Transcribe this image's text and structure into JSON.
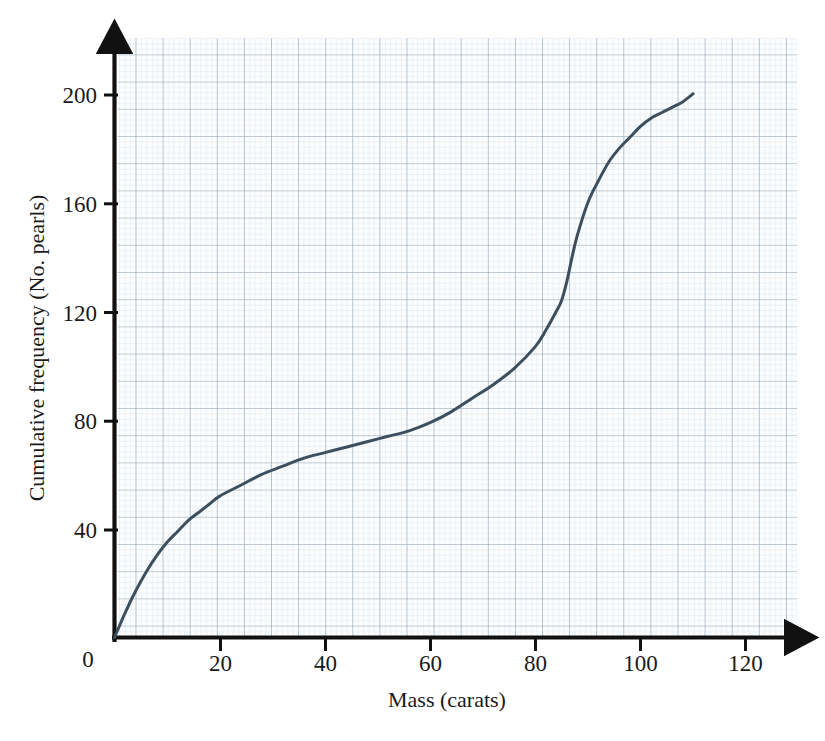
{
  "chart_data": {
    "type": "line",
    "title": "",
    "subtitle": "",
    "xlabel": "Mass (carats)",
    "ylabel": "Cumulative frequency (No. pearls)",
    "xlim": [
      0,
      130
    ],
    "ylim": [
      0,
      215
    ],
    "xticks": [
      0,
      20,
      40,
      60,
      80,
      100,
      120
    ],
    "xtick_labels": [
      "0",
      "20",
      "40",
      "60",
      "80",
      "100",
      "120"
    ],
    "yticks": [
      40,
      80,
      120,
      160,
      200
    ],
    "ytick_labels": [
      "40",
      "80",
      "120",
      "160",
      "200"
    ],
    "grid": true,
    "grid_major_step_x": 5,
    "grid_minor_step_x": 1,
    "legend": "none",
    "series": [
      {
        "name": "Cumulative frequency",
        "color": "#3c4f5e",
        "line_width": 3,
        "x": [
          0,
          2,
          4,
          6,
          8,
          10,
          12,
          14,
          16,
          18,
          20,
          24,
          28,
          32,
          36,
          40,
          44,
          48,
          52,
          56,
          60,
          64,
          68,
          72,
          76,
          80,
          82,
          84,
          85,
          86,
          87,
          88,
          90,
          92,
          94,
          96,
          98,
          100,
          102,
          104,
          106,
          108,
          110
        ],
        "y": [
          0,
          9,
          17,
          24,
          30,
          35,
          39,
          43,
          46,
          49,
          52,
          56,
          60,
          63,
          66,
          68,
          70,
          72,
          74,
          76,
          79,
          83,
          88,
          93,
          99,
          107,
          113,
          120,
          124,
          131,
          140,
          148,
          160,
          168,
          175,
          180,
          184,
          188,
          191,
          193,
          195,
          197,
          200
        ]
      }
    ],
    "colors": {
      "curve": "#3c4f5e",
      "axis": "#111111",
      "grid_major": "#8fa3b5",
      "grid_minor": "#cfdce6",
      "background": "#ffffff",
      "grid_background": "#fcfdfe",
      "text": "#1a1a1a"
    }
  },
  "axes": {
    "x_axis_name": "Mass (carats)",
    "y_axis_name": "Cumulative frequency (No. pearls)",
    "origin_label": "0"
  }
}
